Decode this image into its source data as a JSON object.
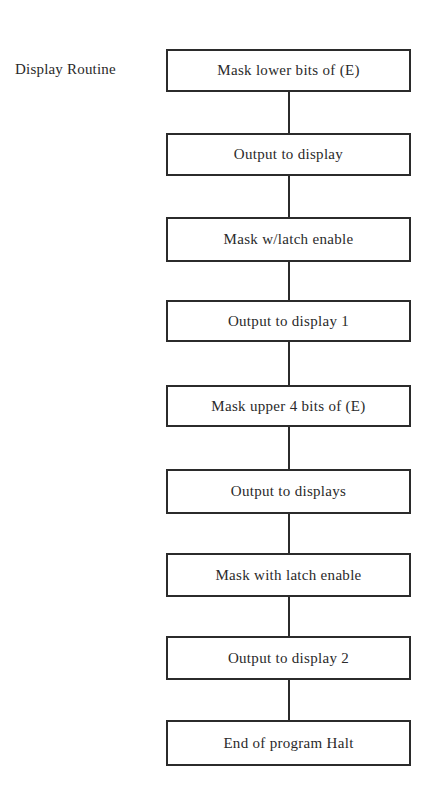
{
  "diagram": {
    "label": "Display Routine",
    "steps": [
      {
        "text": "Mask lower bits of (E)",
        "top": 49,
        "height": 43
      },
      {
        "text": "Output to display",
        "top": 133,
        "height": 43
      },
      {
        "text": "Mask w/latch enable",
        "top": 217,
        "height": 45
      },
      {
        "text": "Output to display 1",
        "top": 300,
        "height": 42
      },
      {
        "text": "Mask upper 4 bits of (E)",
        "top": 385,
        "height": 42
      },
      {
        "text": "Output to displays",
        "top": 469,
        "height": 45
      },
      {
        "text": "Mask with latch enable",
        "top": 553,
        "height": 44
      },
      {
        "text": "Output to display 2",
        "top": 636,
        "height": 44
      },
      {
        "text": "End of program Halt",
        "top": 720,
        "height": 46
      }
    ],
    "colors": {
      "stroke": "#2b2b2b",
      "text": "#2a2a2a",
      "background": "#ffffff"
    }
  }
}
